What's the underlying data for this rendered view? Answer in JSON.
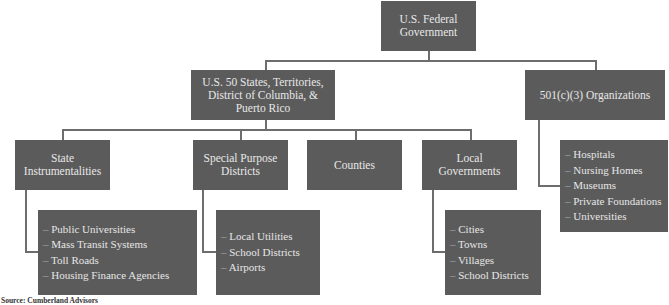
{
  "diagram": {
    "root": {
      "label": "U.S. Federal Government"
    },
    "level1": [
      {
        "label": "U.S. 50 States, Territories, District of Columbia, & Puerto Rico"
      },
      {
        "label": "501(c)(3) Organizations",
        "items": [
          "Hospitals",
          "Nursing Homes",
          "Museums",
          "Private Foundations",
          "Universities"
        ]
      }
    ],
    "level2": [
      {
        "label": "State Instrumentalities",
        "items": [
          "Public Universities",
          "Mass Transit Systems",
          "Toll Roads",
          "Housing Finance Agencies"
        ]
      },
      {
        "label": "Special Purpose Districts",
        "items": [
          "Local Utilities",
          "School Districts",
          "Airports"
        ]
      },
      {
        "label": "Counties"
      },
      {
        "label": "Local Governments",
        "items": [
          "Cities",
          "Towns",
          "Villages",
          "School Districts"
        ]
      }
    ]
  },
  "source": "Source: Cumberland Advisors"
}
